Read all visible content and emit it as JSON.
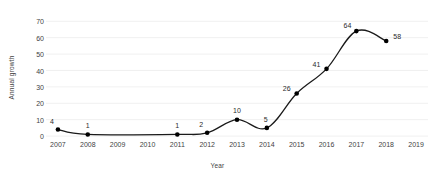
{
  "chart_data": {
    "type": "line",
    "title": "",
    "xlabel": "Year",
    "ylabel": "Annual growth",
    "x": [
      2007,
      2008,
      2009,
      2010,
      2011,
      2012,
      2013,
      2014,
      2015,
      2016,
      2017,
      2018
    ],
    "values": [
      4,
      1,
      null,
      null,
      1,
      2,
      10,
      5,
      26,
      41,
      64,
      58
    ],
    "point_labels": [
      {
        "x": 2007,
        "y": 4,
        "text": "4"
      },
      {
        "x": 2008,
        "y": 1,
        "text": "1"
      },
      {
        "x": 2011,
        "y": 1,
        "text": "1"
      },
      {
        "x": 2012,
        "y": 2,
        "text": "2"
      },
      {
        "x": 2013,
        "y": 10,
        "text": "10"
      },
      {
        "x": 2014,
        "y": 5,
        "text": "5"
      },
      {
        "x": 2015,
        "y": 26,
        "text": "26"
      },
      {
        "x": 2016,
        "y": 41,
        "text": "41"
      },
      {
        "x": 2017,
        "y": 64,
        "text": "64"
      },
      {
        "x": 2018,
        "y": 58,
        "text": "58"
      }
    ],
    "xticks": [
      "2007",
      "2008",
      "2009",
      "2010",
      "2011",
      "2012",
      "2013",
      "2014",
      "2015",
      "2016",
      "2017",
      "2018",
      "2019"
    ],
    "xtick_values": [
      2007,
      2008,
      2009,
      2010,
      2011,
      2012,
      2013,
      2014,
      2015,
      2016,
      2017,
      2018,
      2019
    ],
    "yticks": [
      "0",
      "10",
      "20",
      "30",
      "40",
      "50",
      "60",
      "70"
    ],
    "ytick_values": [
      0,
      10,
      20,
      30,
      40,
      50,
      60,
      70
    ],
    "xlim": [
      2006.6,
      2019.4
    ],
    "ylim": [
      -3,
      72
    ],
    "grid": true,
    "grid_axis": "y",
    "legend": null,
    "colors": {
      "line": "#1a1a1a",
      "marker": "#000000",
      "grid": "#ececec",
      "text": "#3f3f3f",
      "background": "#ffffff"
    },
    "marker_style": "circle",
    "line_width": 1.3
  }
}
